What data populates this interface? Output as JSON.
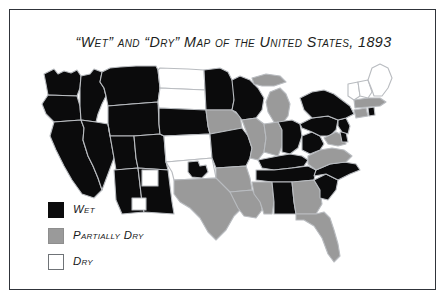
{
  "figure": {
    "title": "“Wet” and “Dry” Map of the United States, 1893",
    "frame_color": "#30343a",
    "background_color": "#ffffff"
  },
  "legend": {
    "items": [
      {
        "label": "Wet",
        "key": "wet",
        "color": "#0b0b0c"
      },
      {
        "label": "Partially Dry",
        "key": "partially_dry",
        "color": "#9a9a9a"
      },
      {
        "label": "Dry",
        "key": "dry",
        "color": "#ffffff"
      }
    ]
  },
  "map_data": {
    "type": "choropleth",
    "region": "United States",
    "year": "1893",
    "border_color": "#b9bcc0",
    "categories": [
      {
        "key": "wet",
        "label": "Wet",
        "color": "#0b0b0c"
      },
      {
        "key": "partially_dry",
        "label": "Partially Dry",
        "color": "#9a9a9a"
      },
      {
        "key": "dry",
        "label": "Dry",
        "color": "#ffffff"
      }
    ],
    "states": [
      {
        "name": "Washington",
        "category": "wet"
      },
      {
        "name": "Oregon",
        "category": "wet"
      },
      {
        "name": "California",
        "category": "wet"
      },
      {
        "name": "Idaho",
        "category": "wet"
      },
      {
        "name": "Nevada",
        "category": "wet"
      },
      {
        "name": "Montana",
        "category": "wet"
      },
      {
        "name": "Wyoming",
        "category": "wet"
      },
      {
        "name": "Utah",
        "category": "wet"
      },
      {
        "name": "Arizona",
        "category": "wet"
      },
      {
        "name": "New Mexico",
        "category": "wet"
      },
      {
        "name": "Colorado",
        "category": "wet"
      },
      {
        "name": "North Dakota",
        "category": "dry"
      },
      {
        "name": "South Dakota",
        "category": "dry"
      },
      {
        "name": "Nebraska",
        "category": "wet"
      },
      {
        "name": "Kansas",
        "category": "dry"
      },
      {
        "name": "Oklahoma",
        "category": "dry"
      },
      {
        "name": "Indian Territory",
        "category": "wet"
      },
      {
        "name": "Texas",
        "category": "partially_dry"
      },
      {
        "name": "Minnesota",
        "category": "wet"
      },
      {
        "name": "Iowa",
        "category": "partially_dry"
      },
      {
        "name": "Missouri",
        "category": "wet"
      },
      {
        "name": "Arkansas",
        "category": "partially_dry"
      },
      {
        "name": "Louisiana",
        "category": "partially_dry"
      },
      {
        "name": "Wisconsin",
        "category": "wet"
      },
      {
        "name": "Illinois",
        "category": "partially_dry"
      },
      {
        "name": "Michigan",
        "category": "partially_dry"
      },
      {
        "name": "Indiana",
        "category": "partially_dry"
      },
      {
        "name": "Ohio",
        "category": "wet"
      },
      {
        "name": "Kentucky",
        "category": "wet"
      },
      {
        "name": "Tennessee",
        "category": "wet"
      },
      {
        "name": "Mississippi",
        "category": "partially_dry"
      },
      {
        "name": "Alabama",
        "category": "wet"
      },
      {
        "name": "Georgia",
        "category": "partially_dry"
      },
      {
        "name": "Florida",
        "category": "partially_dry"
      },
      {
        "name": "South Carolina",
        "category": "wet"
      },
      {
        "name": "North Carolina",
        "category": "wet"
      },
      {
        "name": "Virginia",
        "category": "partially_dry"
      },
      {
        "name": "West Virginia",
        "category": "wet"
      },
      {
        "name": "Maryland",
        "category": "partially_dry"
      },
      {
        "name": "Delaware",
        "category": "wet"
      },
      {
        "name": "Pennsylvania",
        "category": "wet"
      },
      {
        "name": "New Jersey",
        "category": "wet"
      },
      {
        "name": "New York",
        "category": "wet"
      },
      {
        "name": "Connecticut",
        "category": "partially_dry"
      },
      {
        "name": "Rhode Island",
        "category": "wet"
      },
      {
        "name": "Massachusetts",
        "category": "partially_dry"
      },
      {
        "name": "Vermont",
        "category": "dry"
      },
      {
        "name": "New Hampshire",
        "category": "dry"
      },
      {
        "name": "Maine",
        "category": "dry"
      }
    ]
  }
}
